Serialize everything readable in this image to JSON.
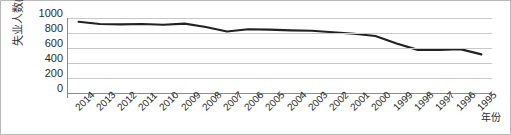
{
  "chart_data": {
    "type": "line",
    "title": "",
    "xlabel": "年份",
    "ylabel": "失业人数(人)",
    "ylim": [
      0,
      1000
    ],
    "yticks": [
      1000,
      800,
      600,
      400,
      200,
      0
    ],
    "grid": true,
    "legend": "none",
    "line_color": "#222222",
    "categories": [
      "2014",
      "2013",
      "2012",
      "2011",
      "2010",
      "2009",
      "2008",
      "2007",
      "2006",
      "2005",
      "2004",
      "2003",
      "2002",
      "2001",
      "2000",
      "1999",
      "1998",
      "1997",
      "1996",
      "1995"
    ],
    "values": [
      950,
      920,
      915,
      920,
      910,
      925,
      880,
      820,
      850,
      845,
      835,
      830,
      810,
      790,
      760,
      660,
      575,
      575,
      585,
      515
    ]
  }
}
